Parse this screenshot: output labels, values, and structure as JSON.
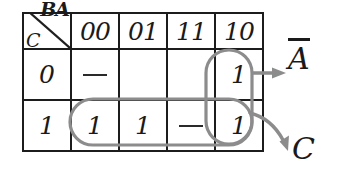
{
  "diagram": {
    "type": "karnaugh-map",
    "axis": {
      "column_variables": "BA",
      "row_variable": "C"
    },
    "column_headers": [
      "00",
      "01",
      "11",
      "10"
    ],
    "row_headers": [
      "0",
      "1"
    ],
    "cells": [
      [
        "—",
        "",
        "",
        "1"
      ],
      [
        "1",
        "1",
        "—",
        "1"
      ]
    ],
    "groups": [
      {
        "name": "vertical-group-column-10",
        "label": "A",
        "label_overbar": true,
        "covers": "column 10, rows 0 and 1",
        "color": "#8c8c8c"
      },
      {
        "name": "horizontal-group-row-1",
        "label": "C",
        "label_overbar": false,
        "covers": "row 1, columns 00 01 11 10",
        "color": "#8c8c8c"
      }
    ],
    "labels": {
      "a_not": "A",
      "a_not_overbar": true,
      "c": "C"
    },
    "colors": {
      "header_fill": "#c9c9c9",
      "cell_fill": "#ffffff",
      "grid_line": "#1c1c1c",
      "ink": "#1a1a1a",
      "annotation": "#8c8c8c"
    },
    "icons": {
      "arrow_top": "arrow-right-icon",
      "arrow_bottom": "arrow-curve-down-right-icon",
      "diagonal": "diagonal-divider-icon"
    }
  }
}
